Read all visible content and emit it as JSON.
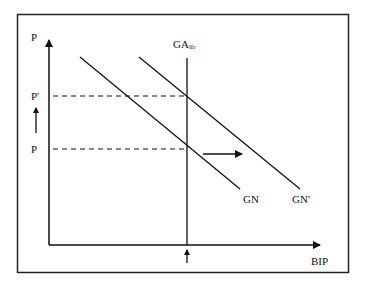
{
  "diagram": {
    "type": "aggregate supply / aggregate demand shift diagram",
    "y_axis_label": "P",
    "x_axis_label": "BIP",
    "vertical_line_label": "GA",
    "vertical_line_subscript": "lfr",
    "price_levels": {
      "high": "P'",
      "low": "P"
    },
    "curves": [
      {
        "id": "gn",
        "label": "GN"
      },
      {
        "id": "gn_prime",
        "label": "GN'"
      }
    ],
    "arrows": {
      "price_increase": "up",
      "demand_shift": "right",
      "output_marker": "up"
    },
    "colors": {
      "line": "#111111",
      "frame": "#222222",
      "background": "#ffffff"
    }
  }
}
